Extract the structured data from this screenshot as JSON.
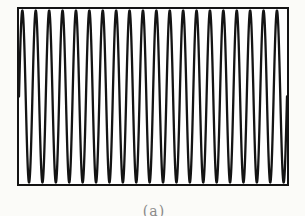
{
  "figure": {
    "caption": "(a)",
    "background_color": "#fbfbf8",
    "frame": {
      "border_color": "#141414",
      "border_width_px": 2.5,
      "fill_color": "#ffffff"
    },
    "wave": {
      "color": "#141414",
      "stroke_width_px": 2.3
    },
    "caption_color": "#8a8a8a"
  },
  "chart_data": {
    "type": "line",
    "waveform": "sine",
    "cycles": 20,
    "amplitude": 1.0,
    "x_range": [
      0,
      1
    ],
    "y_range": [
      -1,
      1
    ],
    "title": "",
    "xlabel": "",
    "ylabel": "",
    "tick_labels": [],
    "legend": [],
    "axes_visible": false,
    "grid": false,
    "frame_visible": true,
    "caption": "(a)"
  }
}
